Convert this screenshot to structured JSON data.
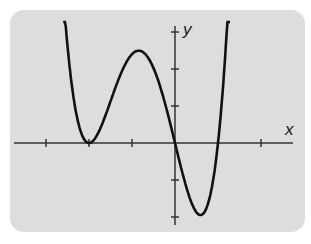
{
  "chart_data": {
    "type": "line",
    "title": "",
    "xlabel": "x",
    "ylabel": "y",
    "grid": false,
    "xlim": [
      -3.0,
      3.15
    ],
    "ylim": [
      -2.1,
      3.0
    ],
    "x_ticks": [
      -3,
      -2,
      -1,
      1,
      2
    ],
    "y_ticks": [
      -2,
      -1,
      1,
      2,
      3
    ],
    "tick_labels_shown": false,
    "series": [
      {
        "name": "y = f(x)",
        "description": "quartic with double root at x=-2, root at x=0, root at x=1; local max near (-1.2, 2.05), local min near (0.7, -1.6)",
        "x": [
          -2.6,
          -2.4,
          -2.2,
          -2.0,
          -1.8,
          -1.6,
          -1.4,
          -1.2,
          -1.0,
          -0.8,
          -0.6,
          -0.4,
          -0.2,
          0.0,
          0.2,
          0.4,
          0.6,
          0.7,
          0.8,
          1.0,
          1.2,
          1.28
        ],
        "y": [
          3.0,
          1.0,
          0.3,
          0.0,
          0.3,
          0.8,
          1.5,
          2.05,
          2.0,
          1.7,
          1.3,
          0.8,
          0.4,
          0.0,
          -0.6,
          -1.2,
          -1.55,
          -1.6,
          -1.45,
          0.0,
          2.0,
          3.0
        ]
      }
    ]
  },
  "labels": {
    "x_axis": "x",
    "y_axis": "y"
  },
  "colors": {
    "background": "#dddddd",
    "curve": "#111111",
    "axes": "#333333"
  }
}
